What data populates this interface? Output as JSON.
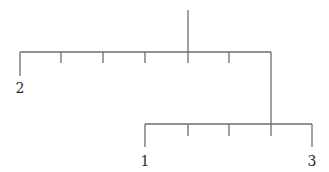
{
  "diagram": {
    "type": "tree",
    "line_color": "#6e6e6e",
    "label_color": "#2a2a2a",
    "labels": {
      "leaf_left_top": "2",
      "leaf_left_bottom": "1",
      "leaf_right_bottom": "3"
    }
  }
}
